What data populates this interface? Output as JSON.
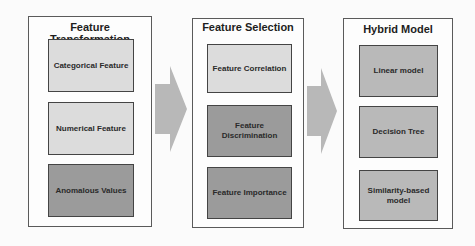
{
  "colors": {
    "light_box": "#dcdcdc",
    "mid_box": "#b9b9b9",
    "dark_box": "#9b9b9b",
    "arrow": "#b8b8b8",
    "border": "#444444"
  },
  "panels": [
    {
      "title": "Feature Transformation",
      "boxes": [
        {
          "label": "Categorical Feature",
          "shade": "light"
        },
        {
          "label": "Numerical Feature",
          "shade": "light"
        },
        {
          "label": "Anomalous Values",
          "shade": "dark"
        }
      ]
    },
    {
      "title": "Feature Selection",
      "boxes": [
        {
          "label": "Feature Correlation",
          "shade": "light"
        },
        {
          "label": "Feature Discrimination",
          "shade": "dark"
        },
        {
          "label": "Feature Importance",
          "shade": "dark"
        }
      ]
    },
    {
      "title": "Hybrid Model",
      "boxes": [
        {
          "label": "Linear model",
          "shade": "mid"
        },
        {
          "label": "Decision Tree",
          "shade": "mid"
        },
        {
          "label": "Similarity-based model",
          "shade": "mid"
        }
      ]
    }
  ],
  "arrows": [
    {
      "from": "Feature Transformation",
      "to": "Feature Selection",
      "icon": "arrow-right-icon"
    },
    {
      "from": "Feature Selection",
      "to": "Hybrid Model",
      "icon": "arrow-right-icon"
    }
  ]
}
